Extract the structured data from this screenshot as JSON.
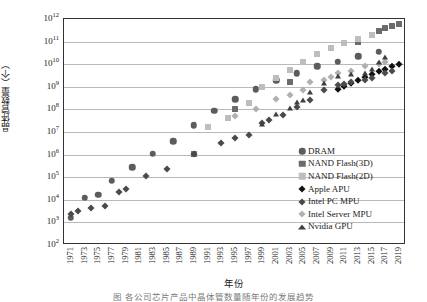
{
  "chart_data": {
    "type": "scatter",
    "title": "",
    "xlabel": "年份",
    "ylabel": "晶体管数量（个）",
    "ylim_exp": [
      2,
      12
    ],
    "xlim": [
      1970,
      2020
    ],
    "grid": true,
    "y_log": true,
    "legend_position": "inside-right",
    "y_ticklabels": [
      "10¹²",
      "10¹¹",
      "10¹⁰",
      "10⁹",
      "10⁸",
      "10⁷",
      "10⁶",
      "10⁵",
      "10⁴",
      "10³",
      "10²"
    ],
    "y_tick_exps": [
      12,
      11,
      10,
      9,
      8,
      7,
      6,
      5,
      4,
      3,
      2
    ],
    "x_ticklabels": [
      "1971",
      "1973",
      "1975",
      "1977",
      "1979",
      "1981",
      "1983",
      "1985",
      "1987",
      "1989",
      "1991",
      "1993",
      "1995",
      "1997",
      "1999",
      "2001",
      "2003",
      "2005",
      "2007",
      "2009",
      "2011",
      "2013",
      "2015",
      "2017",
      "2019"
    ],
    "series": [
      {
        "name": "DRAM",
        "marker": "circle",
        "color": "#5c5c5c",
        "size": 6.5,
        "points": [
          [
            1971,
            3.2
          ],
          [
            1973,
            4.08
          ],
          [
            1975,
            4.23
          ],
          [
            1977,
            4.84
          ],
          [
            1980,
            5.45
          ],
          [
            1983,
            6.04
          ],
          [
            1986,
            6.6
          ],
          [
            1989,
            7.3
          ],
          [
            1992,
            7.95
          ],
          [
            1995,
            8.45
          ],
          [
            1998,
            8.9
          ],
          [
            2001,
            9.28
          ],
          [
            2004,
            9.6
          ],
          [
            2007,
            9.9
          ],
          [
            2010,
            10.1
          ],
          [
            2013,
            10.35
          ],
          [
            2016,
            10.55
          ]
        ]
      },
      {
        "name": "NAND Flash(3D)",
        "marker": "square",
        "color": "#6b6b6b",
        "size": 6,
        "points": [
          [
            1989,
            6.04
          ],
          [
            1995,
            8.0
          ],
          [
            2003,
            9.2
          ],
          [
            2013,
            11.0
          ],
          [
            2015,
            11.3
          ],
          [
            2016,
            11.45
          ],
          [
            2017,
            11.6
          ],
          [
            2018,
            11.68
          ],
          [
            2019,
            11.8
          ]
        ]
      },
      {
        "name": "NAND Flash(2D)",
        "marker": "square",
        "color": "#bdbdbd",
        "size": 6,
        "points": [
          [
            1991,
            7.2
          ],
          [
            1994,
            7.6
          ],
          [
            1997,
            8.3
          ],
          [
            1999,
            9.0
          ],
          [
            2001,
            9.38
          ],
          [
            2003,
            9.75
          ],
          [
            2005,
            10.1
          ],
          [
            2007,
            10.45
          ],
          [
            2009,
            10.7
          ],
          [
            2011,
            10.95
          ],
          [
            2013,
            11.1
          ],
          [
            2015,
            11.3
          ]
        ]
      },
      {
        "name": "Apple APU",
        "marker": "diamond",
        "color": "#111111",
        "size": 6,
        "points": [
          [
            2010,
            8.9
          ],
          [
            2011,
            9.05
          ],
          [
            2012,
            9.15
          ],
          [
            2013,
            9.3
          ],
          [
            2014,
            9.45
          ],
          [
            2015,
            9.55
          ],
          [
            2016,
            9.68
          ],
          [
            2017,
            9.78
          ],
          [
            2018,
            9.9
          ],
          [
            2019,
            10.0
          ]
        ]
      },
      {
        "name": "Intel PC MPU",
        "marker": "diamond",
        "color": "#4a4a4a",
        "size": 6.5,
        "points": [
          [
            1971,
            3.36
          ],
          [
            1972,
            3.5
          ],
          [
            1974,
            3.62
          ],
          [
            1976,
            3.74
          ],
          [
            1978,
            4.36
          ],
          [
            1979,
            4.46
          ],
          [
            1982,
            5.05
          ],
          [
            1985,
            5.35
          ],
          [
            1989,
            6.02
          ],
          [
            1993,
            6.5
          ],
          [
            1995,
            6.73
          ],
          [
            1997,
            6.88
          ],
          [
            1999,
            7.4
          ],
          [
            2000,
            7.54
          ],
          [
            2002,
            7.74
          ],
          [
            2004,
            8.12
          ],
          [
            2006,
            8.4
          ],
          [
            2008,
            8.85
          ],
          [
            2010,
            9.06
          ],
          [
            2011,
            9.14
          ],
          [
            2012,
            9.2
          ],
          [
            2014,
            9.3
          ],
          [
            2015,
            9.4
          ],
          [
            2017,
            9.6
          ],
          [
            2018,
            9.7
          ]
        ]
      },
      {
        "name": "Intel Server MPU",
        "marker": "diamond",
        "color": "#b0b0b0",
        "size": 6.5,
        "points": [
          [
            1995,
            7.72
          ],
          [
            1998,
            8.0
          ],
          [
            2001,
            8.44
          ],
          [
            2003,
            8.62
          ],
          [
            2005,
            8.85
          ],
          [
            2006,
            9.2
          ],
          [
            2008,
            9.3
          ],
          [
            2009,
            9.42
          ],
          [
            2010,
            9.6
          ],
          [
            2012,
            9.72
          ],
          [
            2014,
            9.9
          ],
          [
            2016,
            10.0
          ],
          [
            2017,
            10.1
          ]
        ]
      },
      {
        "name": "Nvidia GPU",
        "marker": "triangle",
        "color": "#3f3f3f",
        "size": 6,
        "points": [
          [
            1999,
            7.36
          ],
          [
            2001,
            7.78
          ],
          [
            2003,
            8.08
          ],
          [
            2004,
            8.32
          ],
          [
            2005,
            8.42
          ],
          [
            2006,
            8.78
          ],
          [
            2008,
            9.15
          ],
          [
            2010,
            9.48
          ],
          [
            2012,
            9.55
          ],
          [
            2014,
            9.62
          ],
          [
            2015,
            9.8
          ],
          [
            2016,
            10.1
          ],
          [
            2017,
            10.3
          ]
        ]
      }
    ],
    "legend_entries": [
      {
        "label": "DRAM",
        "marker": "circle",
        "color": "#5c5c5c"
      },
      {
        "label": "NAND Flash(3D)",
        "marker": "square",
        "color": "#6b6b6b"
      },
      {
        "label": "NAND Flash(2D)",
        "marker": "square",
        "color": "#bdbdbd"
      },
      {
        "label": "Apple APU",
        "marker": "diamond",
        "color": "#111111"
      },
      {
        "label": "Intel PC MPU",
        "marker": "diamond",
        "color": "#4a4a4a"
      },
      {
        "label": "Intel Server MPU",
        "marker": "diamond",
        "color": "#b0b0b0"
      },
      {
        "label": "Nvidia GPU",
        "marker": "triangle",
        "color": "#3f3f3f"
      }
    ]
  },
  "caption": "图   各公司芯片产品中晶体管数量随年份的发展趋势"
}
